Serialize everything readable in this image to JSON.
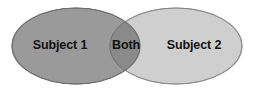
{
  "figure": {
    "type": "venn-diagram",
    "background_color": "#ffffff",
    "width": 256,
    "height": 92
  },
  "sets": {
    "left": {
      "label": "Subject 1",
      "fill_color": "#9a9a9a",
      "stroke_color": "#6e6e6e",
      "center_x": 76,
      "center_y": 46,
      "radius_x": 64,
      "radius_y": 38
    },
    "right": {
      "label": "Subject 2",
      "fill_color": "#cfcfcf",
      "stroke_color": "#8c8c8c",
      "center_x": 176,
      "center_y": 46,
      "radius_x": 66,
      "radius_y": 38
    },
    "intersection": {
      "label": "Both",
      "fill_color": "#8a8a8a",
      "stroke_color": "#5f5f5f"
    }
  },
  "text_color": "#121212"
}
